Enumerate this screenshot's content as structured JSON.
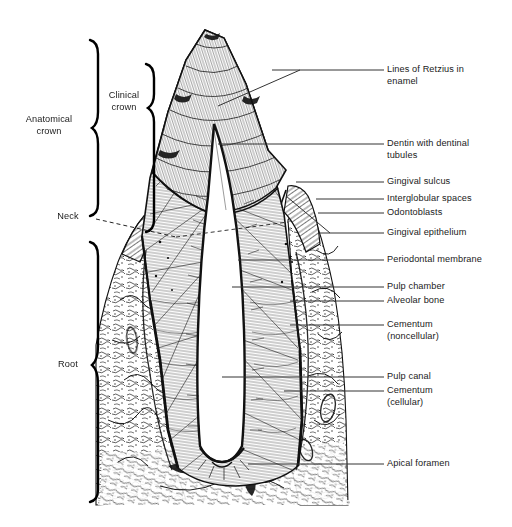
{
  "figure": {
    "style": "black-and-white line engraving",
    "ink_color": "#111111",
    "background_color": "#ffffff"
  },
  "left_brackets": [
    {
      "id": "anatomical-crown",
      "label": "Anatomical\ncrown",
      "label_line1": "Anatomical",
      "label_line2": "crown",
      "span_top": 38,
      "span_bottom": 216,
      "brace_x": 96,
      "label_x": 14,
      "label_y": 120
    },
    {
      "id": "clinical-crown",
      "label": "Clinical\ncrown",
      "label_line1": "Clinical",
      "label_line2": "crown",
      "span_top": 62,
      "span_bottom": 232,
      "brace_x": 152,
      "label_x": 100,
      "label_y": 96
    },
    {
      "id": "root",
      "label": "Root",
      "span_top": 241,
      "span_bottom": 502,
      "brace_x": 96,
      "label_x": 54,
      "label_y": 360
    }
  ],
  "left_markers": [
    {
      "id": "neck",
      "label": "Neck",
      "label_x": 52,
      "label_y": 212,
      "dash_from_x": 96,
      "dash_from_y": 219,
      "dash_to_x": 176,
      "dash_to_y": 236
    }
  ],
  "callouts": [
    {
      "id": "lines-of-retzius",
      "label": "Lines of Retzius in\nenamel",
      "line1": "Lines of Retzius in",
      "line2": "enamel",
      "text_x": 387,
      "text_y": 64,
      "leader_y": 70,
      "leader_x1": 272,
      "leader_x2": 384,
      "pointer": true,
      "pointer_to_x": 218,
      "pointer_to_y": 106
    },
    {
      "id": "dentin-with-dentinal-tubules",
      "label": "Dentin with dentinal\ntubules",
      "line1": "Dentin with dentinal",
      "line2": "tubules",
      "text_x": 387,
      "text_y": 138,
      "leader_y": 144,
      "leader_x1": 218,
      "leader_x2": 384,
      "pointer": false
    },
    {
      "id": "gingival-sulcus",
      "label": "Gingival sulcus",
      "text_x": 387,
      "text_y": 177,
      "leader_y": 182,
      "leader_x1": 296,
      "leader_x2": 384,
      "pointer": false
    },
    {
      "id": "interglobular-spaces",
      "label": "Interglobular spaces",
      "text_x": 387,
      "text_y": 194,
      "leader_y": 199,
      "leader_x1": 316,
      "leader_x2": 384,
      "pointer": false
    },
    {
      "id": "odontoblasts",
      "label": "Odontoblasts",
      "text_x": 387,
      "text_y": 208,
      "leader_y": 213,
      "leader_x1": 318,
      "leader_x2": 384,
      "pointer": false
    },
    {
      "id": "gingival-epithelium",
      "label": "Gingival epithelium",
      "text_x": 387,
      "text_y": 228,
      "leader_y": 233,
      "leader_x1": 318,
      "leader_x2": 384,
      "pointer": true,
      "pointer_to_x": 286,
      "pointer_to_y": 196
    },
    {
      "id": "periodontal-membrane",
      "label": "Periodontal membrane",
      "text_x": 387,
      "text_y": 255,
      "leader_y": 260,
      "leader_x1": 238,
      "leader_x2": 384,
      "pointer": false
    },
    {
      "id": "pulp-chamber",
      "label": "Pulp chamber",
      "text_x": 387,
      "text_y": 282,
      "leader_y": 287,
      "leader_x1": 232,
      "leader_x2": 384,
      "pointer": false
    },
    {
      "id": "alveolar-bone",
      "label": "Alveolar bone",
      "text_x": 387,
      "text_y": 296,
      "leader_y": 301,
      "leader_x1": 290,
      "leader_x2": 384,
      "pointer": false
    },
    {
      "id": "cementum-noncellular",
      "label": "Cementum\n(noncellular)",
      "line1": "Cementum",
      "line2": "(noncellular)",
      "text_x": 387,
      "text_y": 320,
      "leader_y": 325,
      "leader_x1": 290,
      "leader_x2": 384,
      "pointer": false
    },
    {
      "id": "pulp-canal",
      "label": "Pulp canal",
      "text_x": 387,
      "text_y": 372,
      "leader_y": 377,
      "leader_x1": 222,
      "leader_x2": 384,
      "pointer": false
    },
    {
      "id": "cementum-cellular",
      "label": "Cementum\n(cellular)",
      "line1": "Cementum",
      "line2": "(cellular)",
      "text_x": 387,
      "text_y": 386,
      "leader_y": 391,
      "leader_x1": 284,
      "leader_x2": 384,
      "pointer": false
    },
    {
      "id": "apical-foramen",
      "label": "Apical foramen",
      "text_x": 387,
      "text_y": 459,
      "leader_y": 464,
      "leader_x1": 248,
      "leader_x2": 384,
      "pointer": false
    }
  ],
  "anatomy_regions": [
    {
      "id": "enamel",
      "note": "hatched cap over crown apex"
    },
    {
      "id": "dentin",
      "note": "radial striations, bulk of crown and root"
    },
    {
      "id": "pulp-cavity",
      "note": "white open chamber and canal down the centre"
    },
    {
      "id": "gingiva",
      "note": "gum tissue wedge flanking the neck"
    },
    {
      "id": "alveolar-bone",
      "note": "mottled trabecular bone in lower half"
    },
    {
      "id": "periodontal-ligament",
      "note": "dark band between cementum and bone"
    }
  ]
}
